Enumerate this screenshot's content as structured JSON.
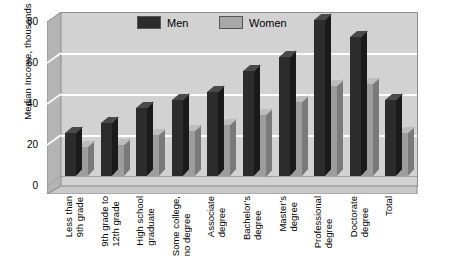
{
  "chart_data": {
    "type": "bar",
    "title": "",
    "xlabel": "",
    "ylabel": "Median Income, thousands",
    "ylim": [
      0,
      80
    ],
    "yticks": [
      0,
      20,
      40,
      60,
      80
    ],
    "grid": true,
    "legend_position": "top-center",
    "categories": [
      "Less than\n9th grade",
      "9th grade to\n12th grade",
      "High school\ngraduate",
      "Some college,\nno degree",
      "Associate\ndegree",
      "Bachelor's\ndegree",
      "Master's\ndegree",
      "Professional\ndegree",
      "Doctorate\ndegree",
      "Total"
    ],
    "series": [
      {
        "name": "Men",
        "color": "#2c2c2c",
        "values": [
          21,
          26,
          33,
          37,
          41,
          51,
          58,
          76,
          68,
          37
        ]
      },
      {
        "name": "Women",
        "color": "#9d9d9d",
        "values": [
          14,
          15,
          20,
          22,
          25,
          30,
          36,
          44,
          45,
          21
        ]
      }
    ]
  },
  "legend": {
    "men_label": "Men",
    "women_label": "Women"
  },
  "axis": {
    "y_title": "Median Income, thousands",
    "tick_80": "80",
    "tick_60": "60",
    "tick_40": "40",
    "tick_20": "20",
    "tick_0": "0"
  }
}
